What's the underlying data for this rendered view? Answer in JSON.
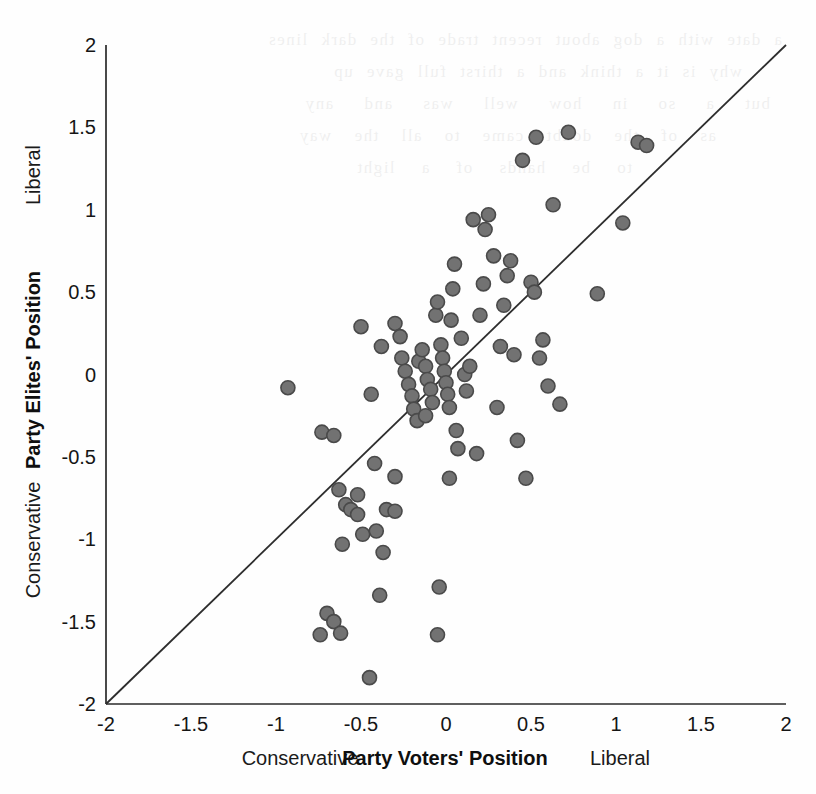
{
  "figure": {
    "background_color": "#fefefe",
    "marker_fill": "#727272",
    "marker_stroke": "#4a4a4a",
    "axis_color": "#2a2a2a",
    "reference_line_color": "#2d2d2d"
  },
  "bleed_text": {
    "line1": "a date with a dog about recent trade of the dark lines",
    "line2": "why is it a think and a thirst full gave up",
    "line3": "but a so in how well was and any",
    "line4": "as of the doubt came to all the way",
    "line5": "to be hands of a light"
  },
  "chart_data": {
    "type": "scatter",
    "title": "",
    "subtitle": "",
    "xlabel": "Party Voters' Position",
    "ylabel": "Party Elites' Position",
    "xlabel_left_anchor": "Conservative",
    "xlabel_right_anchor": "Liberal",
    "ylabel_bottom_anchor": "Conservative",
    "ylabel_top_anchor": "Liberal",
    "xlim": [
      -2,
      2
    ],
    "ylim": [
      -2,
      2
    ],
    "xticks": [
      -2,
      -1.5,
      -1,
      -0.5,
      0,
      0.5,
      1,
      1.5,
      2
    ],
    "xtick_labels": [
      "-2",
      "-1.5",
      "-1",
      "-0.5",
      "0",
      "0.5",
      "1",
      "1.5",
      "2"
    ],
    "yticks": [
      -2,
      -1.5,
      -1,
      -0.5,
      0,
      0.5,
      1,
      1.5,
      2
    ],
    "ytick_labels": [
      "-2",
      "-1.5",
      "-1",
      "-0.5",
      "0",
      "0.5",
      "1",
      "1.5",
      "2"
    ],
    "grid": false,
    "legend": false,
    "reference_line": {
      "label": "45-degree line",
      "type": "identity",
      "from": [
        -2,
        -2
      ],
      "to": [
        2,
        2
      ]
    },
    "marker_radius_px": 7,
    "points": [
      [
        -0.93,
        -0.08
      ],
      [
        -0.73,
        -0.35
      ],
      [
        -0.66,
        -0.37
      ],
      [
        -0.63,
        -0.7
      ],
      [
        -0.59,
        -0.79
      ],
      [
        -0.56,
        -0.82
      ],
      [
        -0.52,
        -0.85
      ],
      [
        -0.52,
        -0.73
      ],
      [
        -0.49,
        -0.97
      ],
      [
        -0.61,
        -1.03
      ],
      [
        -0.7,
        -1.45
      ],
      [
        -0.66,
        -1.5
      ],
      [
        -0.74,
        -1.58
      ],
      [
        -0.62,
        -1.57
      ],
      [
        -0.45,
        -1.84
      ],
      [
        -0.39,
        -1.34
      ],
      [
        -0.37,
        -1.08
      ],
      [
        -0.41,
        -0.95
      ],
      [
        -0.35,
        -0.82
      ],
      [
        -0.3,
        -0.83
      ],
      [
        -0.3,
        -0.62
      ],
      [
        -0.42,
        -0.54
      ],
      [
        -0.5,
        0.29
      ],
      [
        -0.44,
        -0.12
      ],
      [
        -0.38,
        0.17
      ],
      [
        -0.3,
        0.31
      ],
      [
        -0.27,
        0.23
      ],
      [
        -0.26,
        0.1
      ],
      [
        -0.24,
        0.02
      ],
      [
        -0.22,
        -0.06
      ],
      [
        -0.2,
        -0.13
      ],
      [
        -0.19,
        -0.21
      ],
      [
        -0.17,
        -0.28
      ],
      [
        -0.16,
        0.08
      ],
      [
        -0.14,
        0.15
      ],
      [
        -0.12,
        0.05
      ],
      [
        -0.11,
        -0.03
      ],
      [
        -0.09,
        -0.09
      ],
      [
        -0.08,
        -0.17
      ],
      [
        -0.12,
        -0.25
      ],
      [
        -0.06,
        0.36
      ],
      [
        -0.05,
        0.44
      ],
      [
        -0.03,
        0.18
      ],
      [
        -0.02,
        0.1
      ],
      [
        -0.01,
        0.02
      ],
      [
        0.0,
        -0.05
      ],
      [
        0.01,
        -0.12
      ],
      [
        0.02,
        -0.2
      ],
      [
        0.03,
        0.33
      ],
      [
        0.04,
        0.52
      ],
      [
        0.05,
        0.67
      ],
      [
        0.06,
        -0.34
      ],
      [
        0.07,
        -0.45
      ],
      [
        0.02,
        -0.63
      ],
      [
        -0.04,
        -1.29
      ],
      [
        -0.05,
        -1.58
      ],
      [
        0.09,
        0.22
      ],
      [
        0.11,
        0.0
      ],
      [
        0.12,
        -0.1
      ],
      [
        0.14,
        0.05
      ],
      [
        0.16,
        0.94
      ],
      [
        0.18,
        -0.48
      ],
      [
        0.2,
        0.36
      ],
      [
        0.22,
        0.55
      ],
      [
        0.23,
        0.88
      ],
      [
        0.25,
        0.97
      ],
      [
        0.28,
        0.72
      ],
      [
        0.3,
        -0.2
      ],
      [
        0.32,
        0.17
      ],
      [
        0.34,
        0.42
      ],
      [
        0.36,
        0.6
      ],
      [
        0.38,
        0.69
      ],
      [
        0.4,
        0.12
      ],
      [
        0.42,
        -0.4
      ],
      [
        0.45,
        1.3
      ],
      [
        0.47,
        -0.63
      ],
      [
        0.5,
        0.56
      ],
      [
        0.52,
        0.5
      ],
      [
        0.53,
        1.44
      ],
      [
        0.55,
        0.1
      ],
      [
        0.57,
        0.21
      ],
      [
        0.6,
        -0.07
      ],
      [
        0.63,
        1.03
      ],
      [
        0.67,
        -0.18
      ],
      [
        0.72,
        1.47
      ],
      [
        0.89,
        0.49
      ],
      [
        1.04,
        0.92
      ],
      [
        1.13,
        1.41
      ],
      [
        1.18,
        1.39
      ]
    ]
  }
}
